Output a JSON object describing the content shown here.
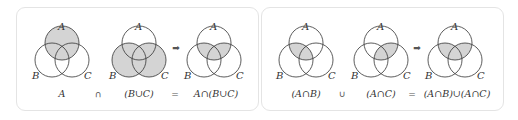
{
  "colors": {
    "shade": "#d4d4d4",
    "stroke": "#333333",
    "panel_border": "#e4e4e4",
    "arrow": "#555555"
  },
  "set_labels": {
    "a": "A",
    "b": "B",
    "c": "C"
  },
  "left_panel": {
    "diagrams": [
      {
        "caption": "A",
        "shaded": "A"
      },
      {
        "caption": "(B∪C)",
        "shaded": "B∪C"
      },
      {
        "caption": "A∩(B∪C)",
        "shaded": "A∩(B∪C)"
      }
    ],
    "operators": {
      "first": "∩",
      "equals": "="
    },
    "arrow": "➡"
  },
  "right_panel": {
    "diagrams": [
      {
        "caption": "(A∩B)",
        "shaded": "A∩B"
      },
      {
        "caption": "(A∩C)",
        "shaded": "A∩C"
      },
      {
        "caption": "(A∩B)∪(A∩C)",
        "shaded": "(A∩B)∪(A∩C)"
      }
    ],
    "operators": {
      "first": "∪",
      "equals": "="
    },
    "arrow": "➡"
  }
}
